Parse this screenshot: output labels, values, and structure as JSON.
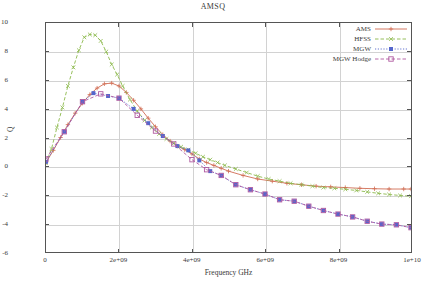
{
  "chart_data": {
    "type": "line",
    "title": "AMSQ",
    "xlabel": "Frequency GHz",
    "ylabel": "Q",
    "xlim": [
      0,
      10000000000
    ],
    "ylim": [
      -6,
      10
    ],
    "xticks": [
      0,
      2000000000,
      4000000000,
      6000000000,
      8000000000,
      10000000000
    ],
    "xtick_labels": [
      "0",
      "2e+09",
      "4e+09",
      "6e+09",
      "8e+09",
      "1e+10"
    ],
    "yticks": [
      -6,
      -4,
      -2,
      0,
      2,
      4,
      6,
      8,
      10
    ],
    "ytick_labels": [
      "-6",
      "-4",
      "-2",
      "0",
      "2",
      "4",
      "6",
      "8",
      "10"
    ],
    "grid": true,
    "legend_position": "top-right",
    "series": [
      {
        "name": "AMS",
        "color": "#d06b52",
        "marker": "plus",
        "line_style": "solid",
        "x": [
          0,
          200000000,
          400000000,
          600000000,
          800000000,
          1000000000,
          1200000000,
          1400000000,
          1600000000,
          1800000000,
          2000000000,
          2200000000,
          2400000000,
          2600000000,
          2800000000,
          3000000000,
          3200000000,
          3400000000,
          3600000000,
          3800000000,
          4000000000,
          4200000000,
          4400000000,
          4600000000,
          4800000000,
          5000000000,
          5400000000,
          5800000000,
          6200000000,
          6600000000,
          7000000000,
          7400000000,
          7800000000,
          8200000000,
          8600000000,
          9000000000,
          9400000000,
          9800000000,
          10000000000
        ],
        "y": [
          0.25,
          1.1,
          2.0,
          2.9,
          3.7,
          4.4,
          5.0,
          5.45,
          5.75,
          5.8,
          5.6,
          5.15,
          4.6,
          4.0,
          3.35,
          2.75,
          2.2,
          1.75,
          1.4,
          1.15,
          0.85,
          0.5,
          0.25,
          0.05,
          -0.15,
          -0.35,
          -0.65,
          -0.9,
          -1.05,
          -1.2,
          -1.3,
          -1.4,
          -1.45,
          -1.5,
          -1.55,
          -1.58,
          -1.6,
          -1.6,
          -1.6
        ]
      },
      {
        "name": "HFSS",
        "color": "#8bb84a",
        "marker": "x",
        "line_style": "dashed",
        "x": [
          0,
          150000000,
          300000000,
          450000000,
          600000000,
          750000000,
          900000000,
          1050000000,
          1200000000,
          1350000000,
          1500000000,
          1650000000,
          1800000000,
          1950000000,
          2100000000,
          2300000000,
          2500000000,
          2700000000,
          2900000000,
          3100000000,
          3300000000,
          3500000000,
          3700000000,
          3900000000,
          4100000000,
          4300000000,
          4500000000,
          4700000000,
          4900000000,
          5200000000,
          5500000000,
          5800000000,
          6100000000,
          6400000000,
          6700000000,
          7000000000,
          7300000000,
          7600000000,
          7900000000,
          8200000000,
          8500000000,
          8800000000,
          9100000000,
          9400000000,
          9700000000,
          10000000000
        ],
        "y": [
          0.2,
          1.2,
          2.7,
          4.1,
          5.6,
          6.9,
          8.1,
          9.0,
          9.2,
          9.15,
          8.75,
          8.0,
          7.1,
          6.4,
          5.6,
          4.65,
          3.85,
          3.2,
          2.7,
          2.25,
          1.9,
          1.6,
          1.35,
          1.15,
          0.9,
          0.65,
          0.45,
          0.25,
          0.05,
          -0.2,
          -0.45,
          -0.7,
          -0.9,
          -1.05,
          -1.2,
          -1.3,
          -1.4,
          -1.5,
          -1.55,
          -1.62,
          -1.7,
          -1.8,
          -1.9,
          -1.98,
          -2.05,
          -2.1
        ]
      },
      {
        "name": "MGW",
        "color": "#5566cc",
        "marker": "filled-square",
        "line_style": "dotted",
        "x": [
          0,
          500000000,
          1000000000,
          1300000000,
          1700000000,
          2000000000,
          2400000000,
          2800000000,
          3200000000,
          3600000000,
          3900000000,
          4200000000,
          4500000000,
          4800000000,
          5200000000,
          5600000000,
          6000000000,
          6400000000,
          6800000000,
          7200000000,
          7600000000,
          8000000000,
          8400000000,
          8800000000,
          9200000000,
          9600000000,
          10000000000
        ],
        "y": [
          0.3,
          2.4,
          4.5,
          5.1,
          4.9,
          4.75,
          4.0,
          3.0,
          2.1,
          1.4,
          1.1,
          0.4,
          -0.35,
          -0.65,
          -1.3,
          -1.65,
          -1.95,
          -2.35,
          -2.45,
          -2.8,
          -3.1,
          -3.35,
          -3.55,
          -3.85,
          -4.05,
          -4.1,
          -4.3
        ]
      },
      {
        "name": "MGW Hodge",
        "color": "#b05aa0",
        "marker": "open-square",
        "line_style": "dashed",
        "x": [
          0,
          500000000,
          1000000000,
          1500000000,
          2000000000,
          2500000000,
          3000000000,
          3500000000,
          4000000000,
          4400000000,
          4800000000,
          5200000000,
          5600000000,
          6000000000,
          6400000000,
          6800000000,
          7200000000,
          7600000000,
          8000000000,
          8400000000,
          8800000000,
          9200000000,
          9600000000,
          10000000000
        ],
        "y": [
          0.5,
          2.4,
          4.5,
          5.05,
          4.75,
          3.55,
          2.45,
          1.55,
          0.45,
          -0.25,
          -0.65,
          -1.3,
          -1.65,
          -1.95,
          -2.35,
          -2.45,
          -2.8,
          -3.1,
          -3.35,
          -3.55,
          -3.85,
          -4.05,
          -4.1,
          -4.3
        ]
      }
    ]
  }
}
